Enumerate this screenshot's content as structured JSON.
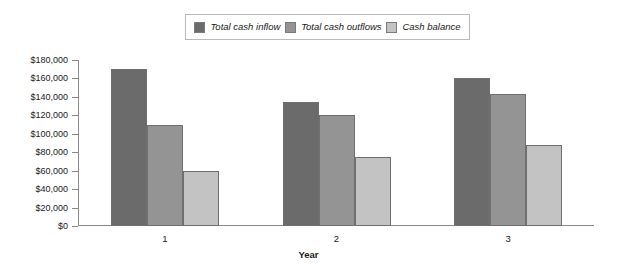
{
  "chart_data": {
    "type": "bar",
    "title": "",
    "xlabel": "Year",
    "ylabel": "",
    "categories": [
      "1",
      "2",
      "3"
    ],
    "series": [
      {
        "name": "Total cash inflow",
        "color": "#6b6b6b",
        "values": [
          170000,
          135000,
          161000
        ]
      },
      {
        "name": "Total cash outflows",
        "color": "#949494",
        "values": [
          110000,
          120000,
          143000
        ]
      },
      {
        "name": "Cash balance",
        "color": "#c3c3c3",
        "values": [
          60000,
          75000,
          88000
        ]
      }
    ],
    "ylim": [
      0,
      180000
    ],
    "ytick_values": [
      0,
      20000,
      40000,
      60000,
      80000,
      100000,
      120000,
      140000,
      160000,
      180000
    ],
    "ytick_labels": [
      "$0",
      "$20,000",
      "$40,000",
      "$60,000",
      "$80,000",
      "$100,000",
      "$120,000",
      "$140,000",
      "$160,000",
      "$180,000"
    ],
    "grid": false,
    "legend_position": "top-center"
  },
  "legend": {
    "items": [
      {
        "label": "Total cash inflow",
        "color": "#6b6b6b"
      },
      {
        "label": "Total cash outflows",
        "color": "#949494"
      },
      {
        "label": "Cash balance",
        "color": "#c3c3c3"
      }
    ]
  },
  "axes": {
    "x_title": "Year"
  }
}
